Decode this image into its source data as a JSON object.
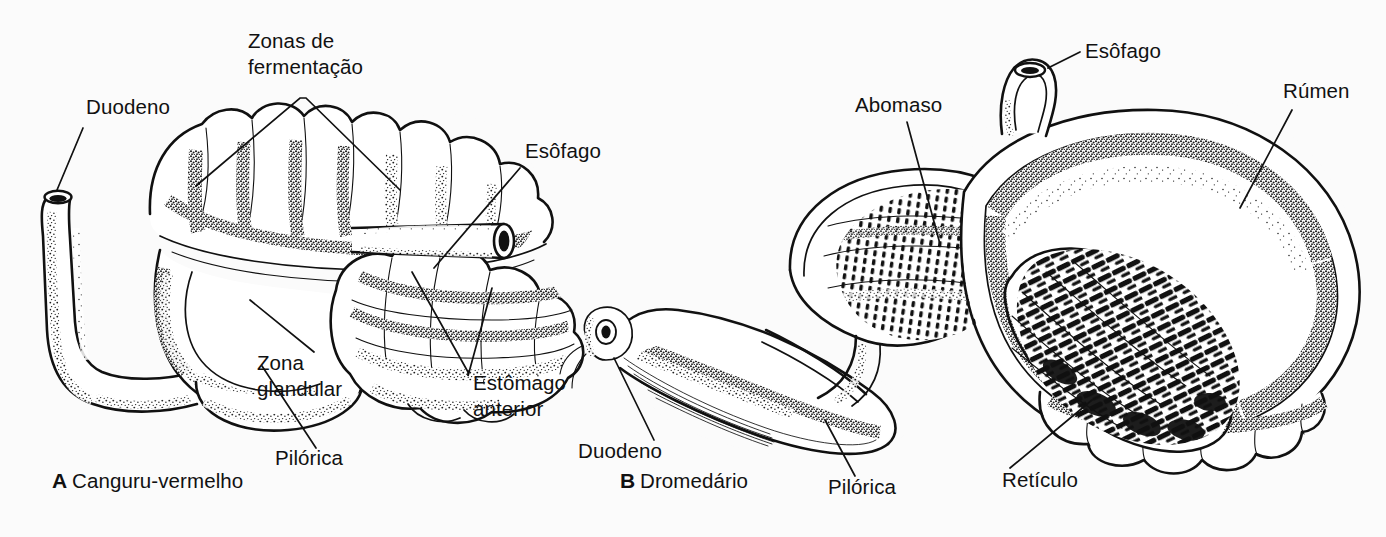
{
  "figure": {
    "background_color": "#fbfbfb",
    "ink_color": "#111111",
    "style": "pen-and-ink scientific illustration, black line art on white"
  },
  "panels": [
    {
      "id": "A",
      "letter": "A",
      "caption": "Canguru-vermelho",
      "caption_x": 52,
      "caption_y": 488,
      "labels": [
        {
          "key": "duodeno",
          "text": "Duodeno",
          "x": 86,
          "y": 114,
          "lines": 1,
          "leader": "from label down-left to the duodenal tube opening"
        },
        {
          "key": "zonas_de_fermentacao",
          "text_line1": "Zonas de",
          "text_line2": "fermentação",
          "x": 248,
          "y": 48,
          "lines": 2,
          "leader": "forked V leader to two sacculated fermentation regions"
        },
        {
          "key": "esofago",
          "text": "Esôfago",
          "x": 525,
          "y": 158,
          "lines": 1,
          "leader": "from label down-left to the oesophageal tube"
        },
        {
          "key": "zona_glandular",
          "text_line1": "Zona",
          "text_line2": "glandular",
          "x": 257,
          "y": 370,
          "lines": 2,
          "leader": "from label up-left to the glandular zone"
        },
        {
          "key": "pilorica",
          "text": "Pilórica",
          "x": 275,
          "y": 465,
          "lines": 1,
          "leader": "from label up-left to the pyloric region"
        },
        {
          "key": "estomago_anterior",
          "text_line1": "Estômago",
          "text_line2": "anterior",
          "x": 473,
          "y": 390,
          "lines": 2,
          "leader": "forked leader up to the anterior stomach sacs"
        }
      ]
    },
    {
      "id": "B",
      "letter": "B",
      "caption": "Dromedário",
      "caption_x": 620,
      "caption_y": 488,
      "labels": [
        {
          "key": "abomaso",
          "text": "Abomaso",
          "x": 855,
          "y": 112,
          "lines": 1,
          "leader": "from label down-right to the abomasum lining"
        },
        {
          "key": "esofago",
          "text": "Esôfago",
          "x": 1085,
          "y": 58,
          "lines": 1,
          "leader": "short leader down-left to the oesophagus neck"
        },
        {
          "key": "rumen",
          "text": "Rúmen",
          "x": 1283,
          "y": 98,
          "lines": 1,
          "leader": "from label down-left into the rumen body"
        },
        {
          "key": "duodeno",
          "text": "Duodeno",
          "x": 578,
          "y": 458,
          "lines": 1,
          "leader": "from label up-right to the duodenum"
        },
        {
          "key": "pilorica",
          "text": "Pilórica",
          "x": 828,
          "y": 494,
          "lines": 1,
          "leader": "from label up-left to the pyloric region"
        },
        {
          "key": "reticulo",
          "text": "Retículo",
          "x": 1002,
          "y": 487,
          "lines": 1,
          "leader": "from label up-right into the honeycombed reticulum"
        }
      ]
    }
  ]
}
